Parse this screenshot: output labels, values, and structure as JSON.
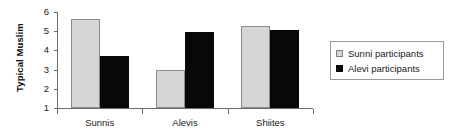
{
  "chart_data": {
    "type": "bar",
    "title": "",
    "xlabel": "",
    "ylabel": "Typical Muslim",
    "categories": [
      "Sunnis",
      "Alevis",
      "Shiites"
    ],
    "series": [
      {
        "name": "Sunni participants",
        "color": "#d6d6d6",
        "values": [
          5.65,
          2.97,
          5.25
        ]
      },
      {
        "name": "Alevi participants",
        "color": "#080808",
        "values": [
          3.7,
          4.95,
          5.05
        ]
      }
    ],
    "ylim": [
      1,
      6
    ],
    "yticks": [
      1,
      2,
      3,
      4,
      5,
      6
    ],
    "ytick_labels": [
      "1",
      "2",
      "3",
      "4",
      "5",
      "6"
    ],
    "grid": false,
    "legend_position": "right"
  },
  "legend": {
    "entries": [
      {
        "label": "Sunni participants",
        "swatch": "light-gray-square"
      },
      {
        "label": "Alevi participants",
        "swatch": "black-square"
      }
    ]
  },
  "axes": {
    "y_title": "Typical Muslim",
    "y_tick_labels": [
      "6",
      "5",
      "4",
      "3",
      "2",
      "1"
    ],
    "x_tick_labels": [
      "Sunnis",
      "Alevis",
      "Shiites"
    ]
  }
}
